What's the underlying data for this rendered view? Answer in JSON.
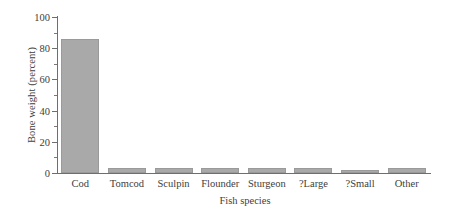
{
  "chart_data": {
    "type": "bar",
    "title": "",
    "xlabel": "Fish species",
    "ylabel": "Bone weight (percent)",
    "categories": [
      "Cod",
      "Tomcod",
      "Sculpin",
      "Flounder",
      "Sturgeon",
      "?Large",
      "?Small",
      "Other"
    ],
    "values": [
      86,
      3,
      3,
      3,
      3,
      3,
      2,
      3
    ],
    "ylim": [
      0,
      100
    ],
    "ytick_labels": [
      "0",
      "20",
      "40",
      "60",
      "80",
      "100"
    ],
    "ytick_values": [
      0,
      20,
      40,
      60,
      80,
      100
    ],
    "yminor_values": [
      10,
      30,
      50,
      70,
      90
    ],
    "grid": false,
    "legend": null,
    "bar_color": "#a9a9a9",
    "axis_color": "#6e6e6e"
  }
}
